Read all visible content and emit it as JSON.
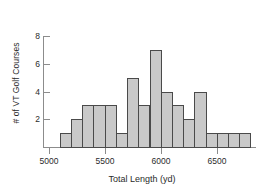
{
  "chart_data": {
    "type": "bar",
    "title": "",
    "subtitle": "",
    "xlabel": "Total Length (yd)",
    "ylabel": "# of VT Golf Courses",
    "grid": false,
    "legend": null,
    "bin_width": 100,
    "bin_starts": [
      5100,
      5200,
      5300,
      5400,
      5500,
      5600,
      5700,
      5800,
      5900,
      6000,
      6100,
      6200,
      6300,
      6400,
      6500,
      6600,
      6700
    ],
    "categories": [
      "5100-5200",
      "5200-5300",
      "5300-5400",
      "5400-5500",
      "5500-5600",
      "5600-5700",
      "5700-5800",
      "5800-5900",
      "5900-6000",
      "6000-6100",
      "6100-6200",
      "6200-6300",
      "6300-6400",
      "6400-6500",
      "6500-6600",
      "6600-6700",
      "6700-6800"
    ],
    "values": [
      1,
      2,
      3,
      3,
      3,
      1,
      5,
      3,
      7,
      4,
      3,
      2,
      4,
      1,
      1,
      1,
      1
    ],
    "xlim": [
      4950,
      6850
    ],
    "ylim": [
      0,
      8
    ],
    "xticks": [
      5000,
      5500,
      6000,
      6500
    ],
    "xtick_labels": [
      "5000",
      "5500",
      "6000",
      "6500"
    ],
    "yticks": [
      2,
      4,
      6,
      8
    ],
    "ytick_labels": [
      "2",
      "4",
      "6",
      "8"
    ],
    "bar_fill_color": "#c9c9c9",
    "bar_edge_color": "#4a4a4a",
    "axis_color": "#8c8c8c",
    "background_color": "#ffffff",
    "total_count": 41
  }
}
